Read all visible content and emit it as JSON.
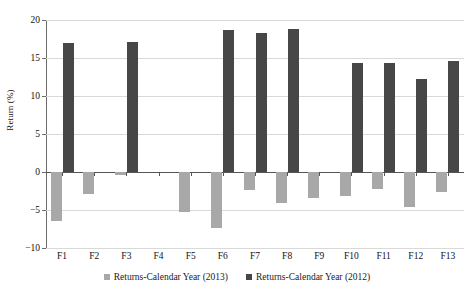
{
  "chart_data": {
    "type": "bar",
    "title": "",
    "xlabel": "",
    "ylabel": "Return (%)",
    "ylim": [
      -10,
      20
    ],
    "yticks": [
      20,
      15,
      10,
      5,
      0,
      -5,
      -10
    ],
    "ytick_labels": [
      "20",
      "15",
      "10",
      "5",
      "0",
      "−5",
      "−10"
    ],
    "grid": true,
    "legend_position": "bottom",
    "categories": [
      "F1",
      "F2",
      "F3",
      "F4",
      "F5",
      "F6",
      "F7",
      "F8",
      "F9",
      "F10",
      "F11",
      "F12",
      "F13"
    ],
    "series": [
      {
        "name": "Returns-Calendar Year (2013)",
        "color": "#a8a8a8",
        "values": [
          -6.4,
          -2.9,
          -0.4,
          0.0,
          -5.3,
          -7.4,
          -2.4,
          -4.1,
          -3.4,
          -3.2,
          -2.2,
          -4.6,
          -2.6
        ]
      },
      {
        "name": "Returns-Calendar Year (2012)",
        "color": "#474747",
        "values": [
          17.0,
          0.0,
          17.1,
          0.0,
          0.0,
          18.7,
          18.3,
          18.8,
          0.0,
          14.3,
          14.3,
          12.3,
          14.6
        ]
      }
    ]
  },
  "legend": {
    "items": [
      {
        "label": "Returns-Calendar Year (2013)",
        "color": "#a8a8a8"
      },
      {
        "label": "Returns-Calendar Year (2012)",
        "color": "#474747"
      }
    ]
  },
  "axis": {
    "y_title": "Return (%)"
  }
}
